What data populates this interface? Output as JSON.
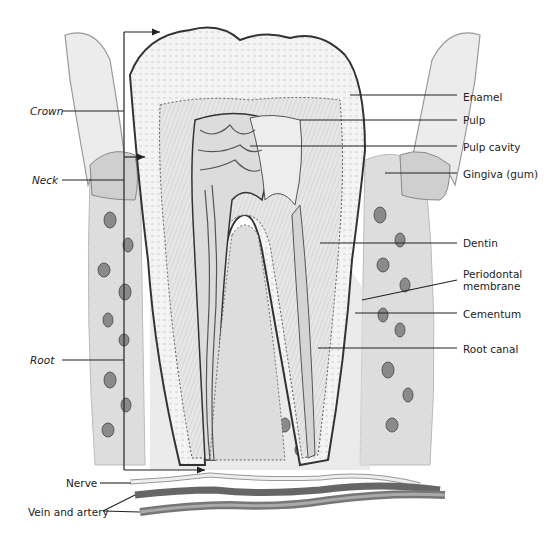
{
  "diagram": {
    "left_labels": [
      {
        "id": "crown",
        "text": "Crown",
        "x": 30,
        "y": 105,
        "line": [
          62,
          111,
          124,
          111
        ],
        "italic": true
      },
      {
        "id": "neck",
        "text": "Neck",
        "x": 32,
        "y": 174,
        "line": [
          62,
          180,
          124,
          180
        ],
        "italic": true
      },
      {
        "id": "root",
        "text": "Root",
        "x": 30,
        "y": 354,
        "line": [
          62,
          360,
          124,
          360
        ],
        "italic": true
      },
      {
        "id": "nerve",
        "text": "Nerve",
        "x": 66,
        "y": 477,
        "line": [
          100,
          483,
          131,
          483
        ],
        "italic": false
      },
      {
        "id": "vein-and-artery",
        "text": "Vein and artery",
        "x": 28,
        "y": 506,
        "line": [
          103,
          511,
          135,
          495
        ],
        "italic": false
      }
    ],
    "right_labels": [
      {
        "id": "enamel",
        "text": "Enamel",
        "x": 463,
        "y": 91,
        "line": [
          350,
          95,
          457,
          95
        ]
      },
      {
        "id": "pulp",
        "text": "Pulp",
        "x": 463,
        "y": 114,
        "line": [
          300,
          120,
          457,
          120
        ]
      },
      {
        "id": "pulp-cavity",
        "text": "Pulp cavity",
        "x": 463,
        "y": 141,
        "line": [
          250,
          146,
          457,
          146
        ]
      },
      {
        "id": "gingiva",
        "text": "Gingiva (gum)",
        "x": 463,
        "y": 168,
        "line": [
          385,
          173,
          457,
          173
        ]
      },
      {
        "id": "dentin",
        "text": "Dentin",
        "x": 463,
        "y": 237,
        "line": [
          320,
          243,
          457,
          243
        ]
      },
      {
        "id": "periodontal-membrane",
        "text": "Periodontal\nmembrane",
        "x": 463,
        "y": 268,
        "line": [
          362,
          300,
          457,
          280
        ]
      },
      {
        "id": "cementum",
        "text": "Cementum",
        "x": 463,
        "y": 308,
        "line": [
          355,
          313,
          457,
          313
        ]
      },
      {
        "id": "root-canal",
        "text": "Root canal",
        "x": 463,
        "y": 343,
        "line": [
          318,
          348,
          457,
          348
        ]
      }
    ],
    "brackets": {
      "crown_bracket": "arrow from left vertical line to crown top",
      "root_bracket": "arrow from left vertical line to root apex"
    }
  }
}
